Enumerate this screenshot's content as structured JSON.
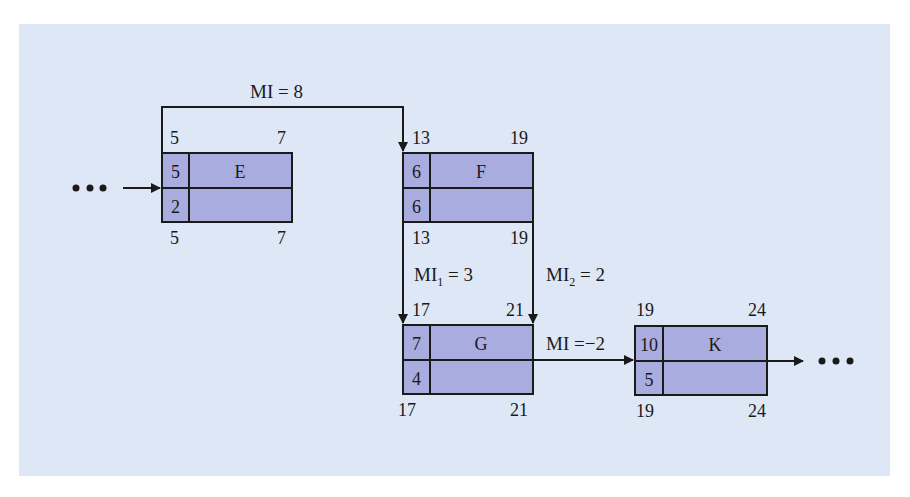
{
  "diagram": {
    "type": "precedence-network (MPM / activity-on-node)",
    "nodes": [
      {
        "id": "E",
        "name": "E",
        "duration": "5",
        "float": "2",
        "earliest_start": "5",
        "earliest_finish": "7",
        "latest_start": "5",
        "latest_finish": "7"
      },
      {
        "id": "F",
        "name": "F",
        "duration": "6",
        "float": "6",
        "earliest_start": "13",
        "earliest_finish": "19",
        "latest_start": "13",
        "latest_finish": "19"
      },
      {
        "id": "G",
        "name": "G",
        "duration": "7",
        "float": "4",
        "earliest_start": "17",
        "earliest_finish": "21",
        "latest_start": "17",
        "latest_finish": "21"
      },
      {
        "id": "K",
        "name": "K",
        "duration": "10",
        "float": "5",
        "earliest_start": "19",
        "earliest_finish": "24",
        "latest_start": "19",
        "latest_finish": "24"
      }
    ],
    "edges": [
      {
        "from": "E",
        "to": "F",
        "label_main": "MI = 8",
        "label_sub": ""
      },
      {
        "from": "F",
        "to": "G",
        "label_main": "MI",
        "label_sub": "1",
        "label_tail": " = 3"
      },
      {
        "from": "F",
        "to": "G",
        "label_main": "MI",
        "label_sub": "2",
        "label_tail": " = 2"
      },
      {
        "from": "G",
        "to": "K",
        "label_main": "MI =−2",
        "label_sub": ""
      }
    ],
    "continuation_left": "•••",
    "continuation_right": "•••",
    "colors": {
      "panel_bg": "#dde7f6",
      "node_fill": "#a9acdf",
      "line": "#1a1a1a"
    }
  }
}
